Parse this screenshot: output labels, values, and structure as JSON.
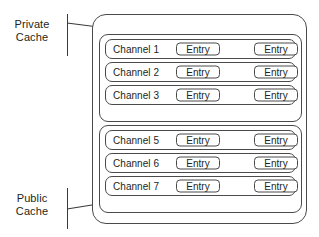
{
  "diagram": {
    "stroke_color": "#4a4a4a",
    "text_color": "#231f20",
    "background_color": "#ffffff"
  },
  "labels": {
    "private_cache": "Private\nCache",
    "public_cache": "Public\nCache"
  },
  "groups": [
    {
      "id": "private-cache-group",
      "label": "Private Cache",
      "rows": [
        {
          "channel": "Channel 1",
          "entries": [
            "Entry",
            "Entry"
          ]
        },
        {
          "channel": "Channel 2",
          "entries": [
            "Entry",
            "Entry"
          ]
        },
        {
          "channel": "Channel 3",
          "entries": [
            "Entry",
            "Entry"
          ]
        }
      ]
    },
    {
      "id": "public-cache-group",
      "label": "Public Cache",
      "rows": [
        {
          "channel": "Channel 5",
          "entries": [
            "Entry",
            "Entry"
          ]
        },
        {
          "channel": "Channel 6",
          "entries": [
            "Entry",
            "Entry"
          ]
        },
        {
          "channel": "Channel 7",
          "entries": [
            "Entry",
            "Entry"
          ]
        }
      ]
    }
  ]
}
